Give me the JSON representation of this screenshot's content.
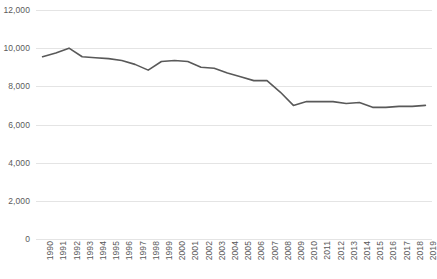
{
  "chart_data": {
    "type": "line",
    "title": "",
    "subtitle": "",
    "xlabel": "",
    "ylabel": "",
    "legend": [],
    "legend_position": "none",
    "grid": "horizontal",
    "ylim": [
      0,
      12000
    ],
    "ytick_step": 2000,
    "ytick_labels": [
      "12,000",
      "10,000",
      "8,000",
      "6,000",
      "4,000",
      "2,000",
      "0"
    ],
    "ytick_values": [
      12000,
      10000,
      8000,
      6000,
      4000,
      2000,
      0
    ],
    "categories": [
      "1990",
      "1991",
      "1992",
      "1993",
      "1994",
      "1995",
      "1996",
      "1997",
      "1998",
      "1999",
      "2000",
      "2001",
      "2002",
      "2003",
      "2004",
      "2005",
      "2006",
      "2007",
      "2008",
      "2009",
      "2010",
      "2011",
      "2012",
      "2013",
      "2014",
      "2015",
      "2016",
      "2017",
      "2018",
      "2019"
    ],
    "series": [
      {
        "name": "series-1",
        "color": "#595959",
        "values": [
          9550,
          9750,
          10000,
          9550,
          9500,
          9450,
          9350,
          9150,
          8850,
          9300,
          9350,
          9300,
          9000,
          8950,
          8700,
          8500,
          8300,
          8300,
          7700,
          7000,
          7200,
          7200,
          7200,
          7100,
          7150,
          6900,
          6900,
          6950,
          6950,
          7000
        ]
      }
    ],
    "colors": {
      "line": "#595959",
      "gridline": "#e4e4e4",
      "tick_text": "#5a5a5a",
      "background": "#ffffff"
    }
  }
}
